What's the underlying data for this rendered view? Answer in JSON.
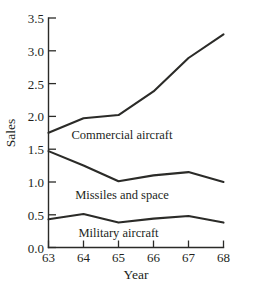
{
  "chart_data": {
    "type": "line",
    "title": "",
    "xlabel": "Year",
    "ylabel": "Sales",
    "x": [
      63,
      64,
      65,
      66,
      67,
      68
    ],
    "xtick_labels": [
      "63",
      "64",
      "65",
      "66",
      "67",
      "68"
    ],
    "ytick_labels": [
      "0.0",
      "0.5",
      "1.0",
      "1.5",
      "2.0",
      "2.5",
      "3.0",
      "3.5"
    ],
    "ytick_values": [
      0.0,
      0.5,
      1.0,
      1.5,
      2.0,
      2.5,
      3.0,
      3.5
    ],
    "xlim": [
      63,
      68
    ],
    "ylim": [
      0.0,
      3.5
    ],
    "grid": false,
    "legend_position": "inline-annotations",
    "line_color": "#2b2b28",
    "background_color": "#ffffff",
    "series": [
      {
        "name": "Commercial aircraft",
        "values": [
          1.75,
          1.97,
          2.02,
          2.38,
          2.89,
          3.25
        ],
        "label_x": 65.1,
        "label_y": 1.66
      },
      {
        "name": "Missiles and space",
        "values": [
          1.47,
          1.25,
          1.01,
          1.1,
          1.15,
          1.0
        ],
        "label_x": 65.1,
        "label_y": 0.74
      },
      {
        "name": "Military aircraft",
        "values": [
          0.43,
          0.51,
          0.38,
          0.44,
          0.48,
          0.38
        ],
        "label_x": 65.0,
        "label_y": 0.16
      }
    ]
  }
}
